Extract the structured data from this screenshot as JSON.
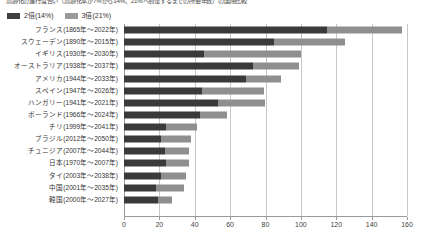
{
  "title": "高齢化の進行度合い（高齢化率が7%から14%、21%へ到達するまでの所要年数）の国際比較",
  "legend": {
    "position": "top-left",
    "items": [
      {
        "label": "2倍(14%)",
        "color": "#3a3a3a"
      },
      {
        "label": "3倍(21%)",
        "color": "#8f8f8f"
      }
    ]
  },
  "axis": {
    "x_ticks": [
      "0",
      "20",
      "40",
      "60",
      "80",
      "100",
      "120",
      "140",
      "160"
    ],
    "x_min": 0,
    "x_max": 160,
    "x_step": 20
  },
  "chart_data": {
    "type": "bar",
    "orientation": "horizontal",
    "stacked": true,
    "title": "高齢化の進行度合い（高齢化率が7%から14%、21%へ到達するまでの所要年数）の国際比較",
    "xlabel": "",
    "ylabel": "",
    "xlim": [
      0,
      160
    ],
    "grid": true,
    "legend_position": "top-left",
    "categories": [
      "フランス(1865年～2022年)",
      "スウェーデン(1890年～2015年)",
      "イギリス(1930年～2030年)",
      "オーストラリア(1938年～2037年)",
      "アメリカ(1944年～2033年)",
      "スペイン(1947年～2026年)",
      "ハンガリー(1941年～2021年)",
      "ポーランド(1966年～2024年)",
      "チリ(1999年～2041年)",
      "ブラジル(2012年～2050年)",
      "チュニジア(2007年～2044年)",
      "日本(1970年～2007年)",
      "タイ(2003年～2038年)",
      "中国(2001年～2035年)",
      "韓国(2000年～2027年)"
    ],
    "series": [
      {
        "name": "2倍(14%)",
        "color": "#3a3a3a",
        "values": [
          115,
          85,
          45,
          73,
          69,
          44,
          53,
          43,
          24,
          21,
          23,
          24,
          21,
          18,
          19
        ]
      },
      {
        "name": "3倍(21%)",
        "color": "#8f8f8f",
        "values": [
          42,
          40,
          55,
          26,
          20,
          35,
          27,
          15,
          17,
          17,
          14,
          13,
          14,
          16,
          8
        ]
      }
    ],
    "totals": [
      157,
      125,
      100,
      99,
      89,
      79,
      80,
      58,
      41,
      38,
      37,
      37,
      35,
      34,
      27
    ]
  }
}
